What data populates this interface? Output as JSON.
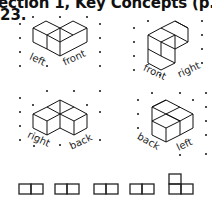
{
  "header": {
    "title": "ection 1, Key Concepts (p. 310)",
    "exercise_number": "23."
  },
  "figures": [
    {
      "id": "fig-1",
      "labels": [
        "left",
        "front"
      ]
    },
    {
      "id": "fig-2",
      "labels": [
        "front",
        "right"
      ]
    },
    {
      "id": "fig-3",
      "labels": [
        "right",
        "back"
      ]
    },
    {
      "id": "fig-4",
      "labels": [
        "back",
        "left"
      ]
    }
  ],
  "orthographic_views": {
    "count": 5,
    "shapes": [
      "two-squares-horizontal",
      "two-squares-horizontal",
      "two-squares-horizontal",
      "two-squares-horizontal",
      "L-shape-three-squares"
    ]
  }
}
